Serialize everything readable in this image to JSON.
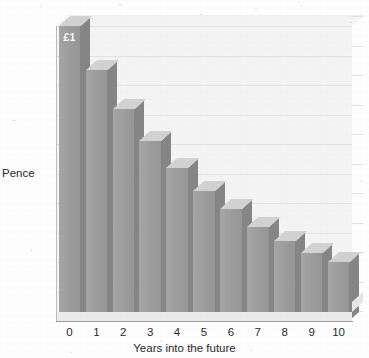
{
  "chart_data": {
    "type": "bar",
    "title": "",
    "subtitle": "",
    "xlabel": "Years into the future",
    "ylabel": "Pence",
    "categories": [
      "0",
      "1",
      "2",
      "3",
      "4",
      "5",
      "6",
      "7",
      "8",
      "9",
      "10"
    ],
    "values": [
      100,
      85,
      72,
      61,
      52,
      44,
      38,
      32,
      27,
      23,
      20
    ],
    "ylim": [
      0,
      100
    ],
    "ytick_labels": [
      "0",
      "10",
      "20",
      "30",
      "40",
      "50",
      "60",
      "70",
      "80",
      "90",
      "100"
    ],
    "ytick_values": [
      0,
      10,
      20,
      30,
      40,
      50,
      60,
      70,
      80,
      90,
      100
    ],
    "grid": true,
    "legend": false,
    "legend_position": "none",
    "annotations": [
      {
        "series_index": 0,
        "text": "£1",
        "position": "inside-top"
      }
    ],
    "bar_color": "#9d9d9d",
    "bar_side_color": "#868686",
    "bar_top_color": "#d2d2d2",
    "plot_background": "#f4f4f4",
    "gridline_color": "#e3e3e3",
    "axis_color": "#9a9a9a",
    "text_color": "#2b2b2b",
    "style": "3d-bar"
  }
}
